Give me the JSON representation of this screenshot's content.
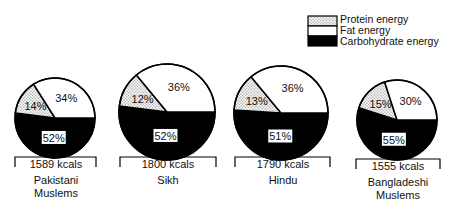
{
  "chart_data": {
    "type": "pie",
    "title": "",
    "legend": [
      {
        "name": "Protein energy",
        "fill": "dotted"
      },
      {
        "name": "Fat energy",
        "fill": "#ffffff"
      },
      {
        "name": "Carbohydrate energy",
        "fill": "#000000"
      }
    ],
    "legend_position": "top-right",
    "categories": [
      "Protein energy",
      "Fat energy",
      "Carbohydrate energy"
    ],
    "pies": [
      {
        "group": "Pakistani Muslems",
        "total": "1589 kcals",
        "values": [
          14,
          34,
          52
        ],
        "labels": [
          "14%",
          "34%",
          "52%"
        ]
      },
      {
        "group": "Sikh",
        "total": "1800 kcals",
        "values": [
          12,
          36,
          52
        ],
        "labels": [
          "12%",
          "36%",
          "52%"
        ]
      },
      {
        "group": "Hindu",
        "total": "1790 kcals",
        "values": [
          13,
          36,
          51
        ],
        "labels": [
          "13%",
          "36%",
          "51%"
        ]
      },
      {
        "group": "Bangladeshi Muslems",
        "total": "1555 kcals",
        "values": [
          15,
          30,
          55
        ],
        "labels": [
          "15%",
          "30%",
          "55%"
        ]
      }
    ]
  },
  "legend": {
    "protein": "Protein energy",
    "fat": "Fat energy",
    "carb": "Carbohydrate energy"
  },
  "captions": [
    {
      "kcal": "1589 kcals",
      "line1": "Pakistani",
      "line2": "Muslems"
    },
    {
      "kcal": "1800 kcals",
      "line1": "Sikh",
      "line2": ""
    },
    {
      "kcal": "1790 kcals",
      "line1": "Hindu",
      "line2": ""
    },
    {
      "kcal": "1555 kcals",
      "line1": "Bangladeshi",
      "line2": "Muslems"
    }
  ]
}
